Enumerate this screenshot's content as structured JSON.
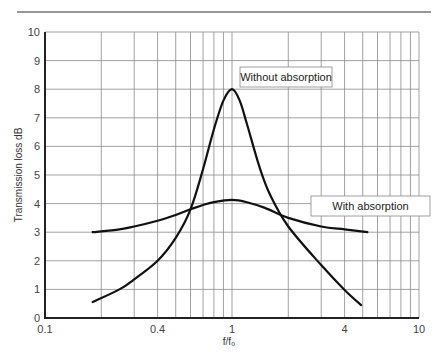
{
  "chart_data": {
    "type": "line",
    "title": "",
    "xlabel": "f/f₀",
    "ylabel": "Transmission loss dB",
    "xscale": "log",
    "xlim": [
      0.1,
      10
    ],
    "ylim": [
      0,
      10
    ],
    "grid": true,
    "x_tick_labels": [
      "0.1",
      "0.4",
      "1",
      "4",
      "10"
    ],
    "x_tick_values": [
      0.1,
      0.4,
      1,
      4,
      10
    ],
    "y_tick_labels": [
      "0",
      "1",
      "2",
      "3",
      "4",
      "5",
      "6",
      "7",
      "8",
      "9",
      "10"
    ],
    "y_tick_values": [
      0,
      1,
      2,
      3,
      4,
      5,
      6,
      7,
      8,
      9,
      10
    ],
    "x_gridlines": [
      0.2,
      0.3,
      0.4,
      0.5,
      0.6,
      0.7,
      0.8,
      0.9,
      1,
      2,
      3,
      4,
      5,
      6,
      7,
      8,
      9,
      10
    ],
    "legend_position": "inline annotation boxes",
    "series": [
      {
        "name": "Without absorption",
        "x": [
          0.18,
          0.25,
          0.3,
          0.4,
          0.5,
          0.6,
          0.7,
          0.8,
          0.9,
          1.0,
          1.1,
          1.2,
          1.4,
          1.6,
          2,
          3,
          4,
          4.9
        ],
        "values": [
          0.56,
          1.0,
          1.35,
          2.0,
          2.8,
          3.8,
          5.2,
          6.6,
          7.6,
          8.0,
          7.6,
          6.8,
          5.3,
          4.3,
          3.2,
          1.85,
          0.98,
          0.45
        ],
        "label_box": {
          "x": 240,
          "y": 67,
          "w": 92,
          "h": 20
        }
      },
      {
        "name": "With absorption",
        "x": [
          0.18,
          0.25,
          0.3,
          0.4,
          0.5,
          0.6,
          0.7,
          0.8,
          1.0,
          1.2,
          1.5,
          2,
          3,
          4,
          5.3
        ],
        "values": [
          3.0,
          3.1,
          3.2,
          3.4,
          3.6,
          3.8,
          3.95,
          4.05,
          4.13,
          4.05,
          3.85,
          3.5,
          3.2,
          3.1,
          3.0
        ],
        "label_box": {
          "x": 311,
          "y": 196,
          "w": 119,
          "h": 20
        }
      }
    ]
  },
  "labels": {
    "without": "Without absorption",
    "with": "With absorption",
    "xlabel": "f/f₀",
    "ylabel": "Transmission loss dB"
  },
  "colors": {
    "curve": "#111111",
    "grid": "#8a8a8a",
    "axis": "#222222",
    "box_border": "#888888"
  }
}
